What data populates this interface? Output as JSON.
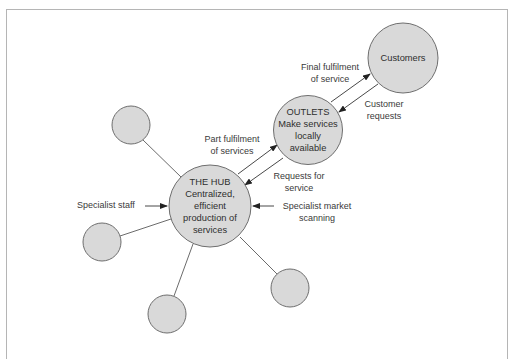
{
  "diagram": {
    "type": "hub-and-spoke",
    "colors": {
      "node_fill": "#d9d9d9",
      "node_stroke": "#6e6e6e",
      "line": "#5a5a5a",
      "text": "#333333",
      "frame": "#b5b5b5"
    },
    "nodes": {
      "hub": {
        "title": "THE HUB",
        "lines": [
          "Centralized,",
          "efficient",
          "production of",
          "services"
        ]
      },
      "outlets": {
        "title": "OUTLETS",
        "lines": [
          "Make services",
          "locally",
          "available"
        ]
      },
      "customers": {
        "title": "Customers"
      },
      "satellites": [
        {
          "label": ""
        },
        {
          "label": ""
        },
        {
          "label": ""
        },
        {
          "label": ""
        }
      ]
    },
    "flows": {
      "final_fulfilment": [
        "Final fulfilment",
        "of service"
      ],
      "customer_requests": [
        "Customer",
        "requests"
      ],
      "part_fulfilment": [
        "Part fulfilment",
        "of services"
      ],
      "requests_for_service": [
        "Requests for",
        "service"
      ],
      "specialist_staff": "Specialist staff",
      "specialist_market_scanning": [
        "Specialist market",
        "scanning"
      ]
    }
  }
}
